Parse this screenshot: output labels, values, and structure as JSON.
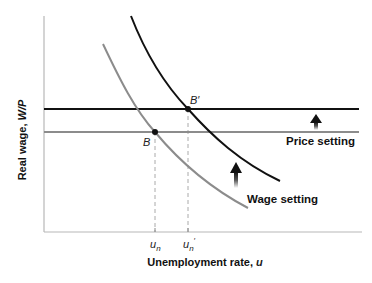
{
  "diagram": {
    "x_axis_label": "Unemployment rate, ",
    "x_axis_var": "u",
    "y_axis_label": "Real wage, ",
    "y_axis_var": "W/P",
    "x_ticks": [
      {
        "base": "u",
        "sub": "n",
        "prime": ""
      },
      {
        "base": "u",
        "sub": "n",
        "prime": "′"
      }
    ],
    "points": [
      {
        "label": "B",
        "description": "initial equilibrium"
      },
      {
        "label": "B′",
        "description": "new equilibrium"
      }
    ],
    "curves": {
      "price_setting_label": "Price setting",
      "wage_setting_label": "Wage setting"
    },
    "colors": {
      "new_curve": "#111111",
      "old_curve": "#8c8c8c",
      "axis": "#b0b0b0",
      "dashed": "#aaaaaa"
    }
  }
}
